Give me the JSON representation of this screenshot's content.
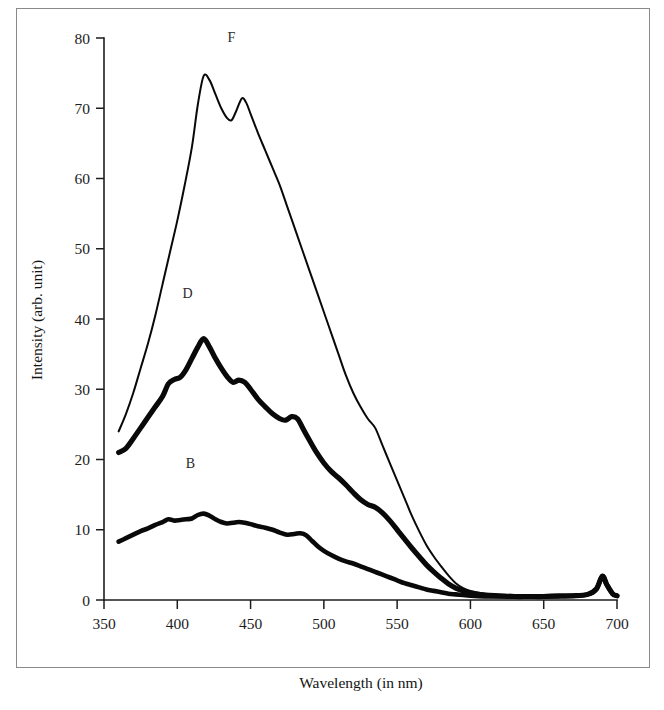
{
  "chart_data": {
    "type": "line",
    "title": "",
    "xlabel": "Wavelength (in nm)",
    "ylabel": "Intensity (arb. unit)",
    "xlim": [
      350,
      700
    ],
    "ylim": [
      0,
      80
    ],
    "xticks": [
      350,
      400,
      450,
      500,
      550,
      600,
      650,
      700
    ],
    "yticks": [
      0,
      10,
      20,
      30,
      40,
      50,
      60,
      70,
      80
    ],
    "xtick_labels": [
      "350",
      "400",
      "450",
      "500",
      "550",
      "600",
      "650",
      "700"
    ],
    "ytick_labels": [
      "0",
      "10",
      "20",
      "30",
      "40",
      "50",
      "60",
      "70",
      "80"
    ],
    "grid": false,
    "legend_position": "inline-annotations",
    "annotations": [
      {
        "text": "F",
        "x": 437,
        "y": 79.5
      },
      {
        "text": "D",
        "x": 407,
        "y": 43.0
      },
      {
        "text": "B",
        "x": 409,
        "y": 18.8
      }
    ],
    "series": [
      {
        "name": "F",
        "label": "F",
        "linewidth": 2.0,
        "color": "#090909",
        "x": [
          360,
          365,
          370,
          375,
          380,
          385,
          390,
          395,
          400,
          405,
          410,
          414,
          418,
          422,
          426,
          430,
          434,
          437,
          440,
          444,
          447,
          450,
          455,
          460,
          465,
          470,
          475,
          480,
          485,
          490,
          495,
          500,
          505,
          510,
          515,
          520,
          525,
          530,
          535,
          540,
          545,
          550,
          555,
          560,
          565,
          570,
          575,
          580,
          585,
          590,
          595,
          600,
          610,
          620,
          630,
          640,
          650,
          660,
          670,
          680,
          686,
          690,
          693,
          697,
          700
        ],
        "y": [
          24.0,
          26.5,
          29.5,
          33.0,
          36.5,
          40.5,
          45.0,
          49.5,
          54.0,
          59.0,
          64.5,
          70.5,
          74.6,
          74.0,
          72.0,
          70.0,
          68.6,
          68.3,
          69.5,
          71.4,
          70.8,
          69.2,
          66.5,
          64.0,
          61.5,
          59.0,
          56.0,
          53.0,
          50.0,
          47.0,
          44.0,
          41.0,
          38.0,
          35.0,
          32.0,
          29.5,
          27.5,
          25.8,
          24.5,
          22.0,
          19.5,
          17.0,
          14.5,
          12.0,
          9.8,
          7.8,
          6.2,
          4.8,
          3.5,
          2.4,
          1.7,
          1.3,
          0.9,
          0.7,
          0.6,
          0.5,
          0.5,
          0.5,
          0.6,
          0.8,
          1.6,
          3.4,
          2.2,
          0.9,
          0.6
        ]
      },
      {
        "name": "D",
        "label": "D",
        "linewidth": 5.2,
        "color": "#090909",
        "x": [
          360,
          365,
          370,
          375,
          380,
          385,
          390,
          394,
          398,
          402,
          406,
          410,
          414,
          418,
          422,
          426,
          430,
          434,
          438,
          442,
          446,
          450,
          455,
          460,
          465,
          470,
          474,
          478,
          482,
          486,
          490,
          495,
          500,
          505,
          510,
          515,
          520,
          525,
          530,
          535,
          540,
          545,
          550,
          555,
          560,
          565,
          570,
          575,
          580,
          585,
          590,
          595,
          600,
          610,
          620,
          630,
          640,
          650,
          660,
          670,
          680,
          686,
          690,
          693,
          697,
          700
        ],
        "y": [
          21.0,
          21.6,
          23.0,
          24.5,
          26.0,
          27.5,
          29.0,
          30.8,
          31.4,
          31.7,
          32.8,
          34.4,
          36.0,
          37.2,
          36.0,
          34.4,
          33.0,
          31.8,
          31.0,
          31.3,
          31.0,
          30.0,
          28.6,
          27.5,
          26.5,
          25.8,
          25.6,
          26.1,
          25.8,
          24.3,
          22.8,
          21.0,
          19.5,
          18.3,
          17.4,
          16.4,
          15.3,
          14.3,
          13.6,
          13.2,
          12.4,
          11.3,
          10.0,
          8.7,
          7.4,
          6.2,
          5.0,
          4.0,
          3.1,
          2.3,
          1.7,
          1.3,
          1.0,
          0.7,
          0.6,
          0.5,
          0.5,
          0.5,
          0.6,
          0.6,
          0.8,
          1.6,
          3.4,
          2.2,
          0.9,
          0.6
        ]
      },
      {
        "name": "B",
        "label": "B",
        "linewidth": 4.6,
        "color": "#090909",
        "x": [
          360,
          365,
          370,
          375,
          380,
          385,
          390,
          394,
          398,
          402,
          406,
          410,
          414,
          418,
          422,
          426,
          430,
          434,
          438,
          442,
          446,
          450,
          455,
          460,
          465,
          470,
          475,
          480,
          484,
          488,
          492,
          496,
          500,
          505,
          510,
          515,
          520,
          525,
          530,
          535,
          540,
          545,
          550,
          555,
          560,
          565,
          570,
          575,
          580,
          585,
          590,
          595,
          600,
          610,
          620,
          630,
          640,
          650,
          660,
          670,
          680,
          686,
          690,
          693,
          697,
          700
        ],
        "y": [
          8.3,
          8.8,
          9.3,
          9.8,
          10.2,
          10.7,
          11.1,
          11.5,
          11.3,
          11.4,
          11.5,
          11.6,
          12.1,
          12.3,
          12.0,
          11.5,
          11.1,
          10.9,
          11.0,
          11.1,
          11.0,
          10.8,
          10.5,
          10.3,
          10.0,
          9.6,
          9.3,
          9.4,
          9.5,
          9.2,
          8.4,
          7.6,
          7.0,
          6.4,
          5.9,
          5.5,
          5.2,
          4.8,
          4.4,
          4.0,
          3.6,
          3.2,
          2.8,
          2.4,
          2.1,
          1.8,
          1.5,
          1.3,
          1.1,
          0.9,
          0.8,
          0.7,
          0.6,
          0.5,
          0.5,
          0.5,
          0.5,
          0.5,
          0.5,
          0.6,
          0.8,
          1.6,
          3.4,
          2.2,
          0.9,
          0.6
        ]
      }
    ]
  },
  "axes": {
    "x_title": "Wavelength (in nm)",
    "y_title": "Intensity (arb. unit)"
  }
}
